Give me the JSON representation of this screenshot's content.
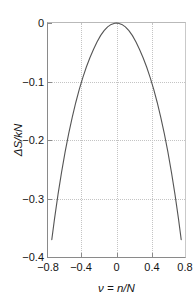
{
  "chart_data": {
    "type": "line",
    "title": "",
    "subtitle": "",
    "xlabel": "ν = n/N",
    "ylabel": "ΔS/kN",
    "xlim": [
      -0.7727,
      0.7727
    ],
    "ylim": [
      -0.4,
      0.0
    ],
    "xticks": [
      -0.8,
      -0.4,
      0,
      0.4,
      0.8
    ],
    "xtick_labels": [
      "−0.8",
      "−0.4",
      "0",
      "0.4",
      "0.8"
    ],
    "yticks": [
      0,
      -0.1,
      -0.2,
      -0.3,
      -0.4
    ],
    "ytick_labels": [
      "0",
      "−0.1",
      "−0.2",
      "−0.3",
      "−0.4"
    ],
    "grid": true,
    "grid_style": "dotted",
    "grid_color": "#c4c4c4",
    "legend": false,
    "legend_position": "none",
    "line_color": "#555555",
    "axis_color": "#8a8a8a",
    "background": "#ffffff",
    "series": [
      {
        "name": "ΔS/kN",
        "formula": "-0.5*[(1+v)ln(1+v) + (1-v)ln(1-v)]",
        "x": [
          -0.73,
          -0.7,
          -0.66,
          -0.62,
          -0.58,
          -0.54,
          -0.5,
          -0.46,
          -0.42,
          -0.38,
          -0.34,
          -0.3,
          -0.26,
          -0.22,
          -0.18,
          -0.14,
          -0.1,
          -0.06,
          -0.02,
          0.0,
          0.02,
          0.06,
          0.1,
          0.14,
          0.18,
          0.22,
          0.26,
          0.3,
          0.34,
          0.38,
          0.42,
          0.46,
          0.5,
          0.54,
          0.58,
          0.62,
          0.66,
          0.7,
          0.73
        ],
        "y": [
          -0.3704,
          -0.3357,
          -0.2934,
          -0.2553,
          -0.2208,
          -0.1897,
          -0.1616,
          -0.1363,
          -0.1136,
          -0.0933,
          -0.0752,
          -0.0593,
          -0.0454,
          -0.0325,
          -0.0216,
          -0.0131,
          -0.0067,
          -0.0024,
          -0.0003,
          0.0,
          -0.0003,
          -0.0024,
          -0.0067,
          -0.0131,
          -0.0216,
          -0.0325,
          -0.0454,
          -0.0593,
          -0.0752,
          -0.0933,
          -0.1136,
          -0.1363,
          -0.1616,
          -0.1897,
          -0.2208,
          -0.2553,
          -0.2934,
          -0.3357,
          -0.3704
        ],
        "peak": {
          "x": 0,
          "y": 0
        },
        "endpoints": [
          {
            "x": -0.73,
            "y": -0.37
          },
          {
            "x": 0.73,
            "y": -0.37
          }
        ]
      }
    ]
  }
}
